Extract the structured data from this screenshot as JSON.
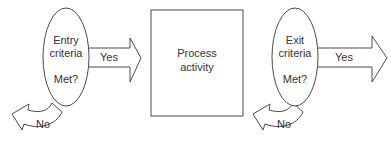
{
  "diagram": {
    "entry": {
      "line1": "Entry",
      "line2": "criteria",
      "question": "Met?",
      "yes_label": "Yes",
      "no_label": "No"
    },
    "process": {
      "line1": "Process",
      "line2": "activity"
    },
    "exit": {
      "line1": "Exit",
      "line2": "criteria",
      "question": "Met?",
      "yes_label": "Yes",
      "no_label": "No"
    },
    "colors": {
      "stroke": "#4a4a4a",
      "text": "#333333",
      "background": "#ffffff"
    }
  }
}
